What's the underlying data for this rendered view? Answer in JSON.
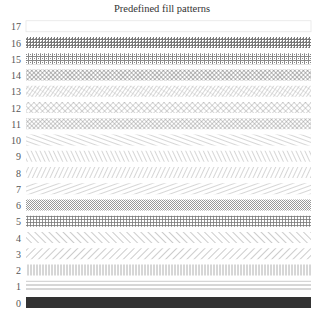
{
  "title": "Predefined fill patterns",
  "chart_data": {
    "type": "bar",
    "title": "Predefined fill patterns",
    "orientation": "horizontal",
    "categories": [
      "0",
      "1",
      "2",
      "3",
      "4",
      "5",
      "6",
      "7",
      "8",
      "9",
      "10",
      "11",
      "12",
      "13",
      "14",
      "15",
      "16",
      "17"
    ],
    "values": [
      1,
      1,
      1,
      1,
      1,
      1,
      1,
      1,
      1,
      1,
      1,
      1,
      1,
      1,
      1,
      1,
      1,
      0
    ],
    "patterns": [
      {
        "id": 0,
        "label": "0",
        "pattern": "solid"
      },
      {
        "id": 1,
        "label": "1",
        "pattern": "horizontal-lines"
      },
      {
        "id": 2,
        "label": "2",
        "pattern": "vertical-lines"
      },
      {
        "id": 3,
        "label": "3",
        "pattern": "diagonal-up-45"
      },
      {
        "id": 4,
        "label": "4",
        "pattern": "diagonal-down-45"
      },
      {
        "id": 5,
        "label": "5",
        "pattern": "orthogonal-grid"
      },
      {
        "id": 6,
        "label": "6",
        "pattern": "fine-checker"
      },
      {
        "id": 7,
        "label": "7",
        "pattern": "diagonal-up-shallow"
      },
      {
        "id": 8,
        "label": "8",
        "pattern": "diagonal-up-steep"
      },
      {
        "id": 9,
        "label": "9",
        "pattern": "diagonal-down-steep"
      },
      {
        "id": 10,
        "label": "10",
        "pattern": "diagonal-down-shallow"
      },
      {
        "id": 11,
        "label": "11",
        "pattern": "crosshatch-dense"
      },
      {
        "id": 12,
        "label": "12",
        "pattern": "crosshatch-45"
      },
      {
        "id": 13,
        "label": "13",
        "pattern": "crosshatch-fine-up"
      },
      {
        "id": 14,
        "label": "14",
        "pattern": "diamond-crosshatch"
      },
      {
        "id": 15,
        "label": "15",
        "pattern": "brick-grid"
      },
      {
        "id": 16,
        "label": "16",
        "pattern": "dense-grid-dots"
      },
      {
        "id": 17,
        "label": "17",
        "pattern": "empty"
      }
    ],
    "xlabel": "",
    "ylabel": "",
    "grid": false,
    "legend": "none"
  },
  "colors": {
    "ink": "#555555",
    "solid": "#333333",
    "border": "#e6e6e6"
  }
}
